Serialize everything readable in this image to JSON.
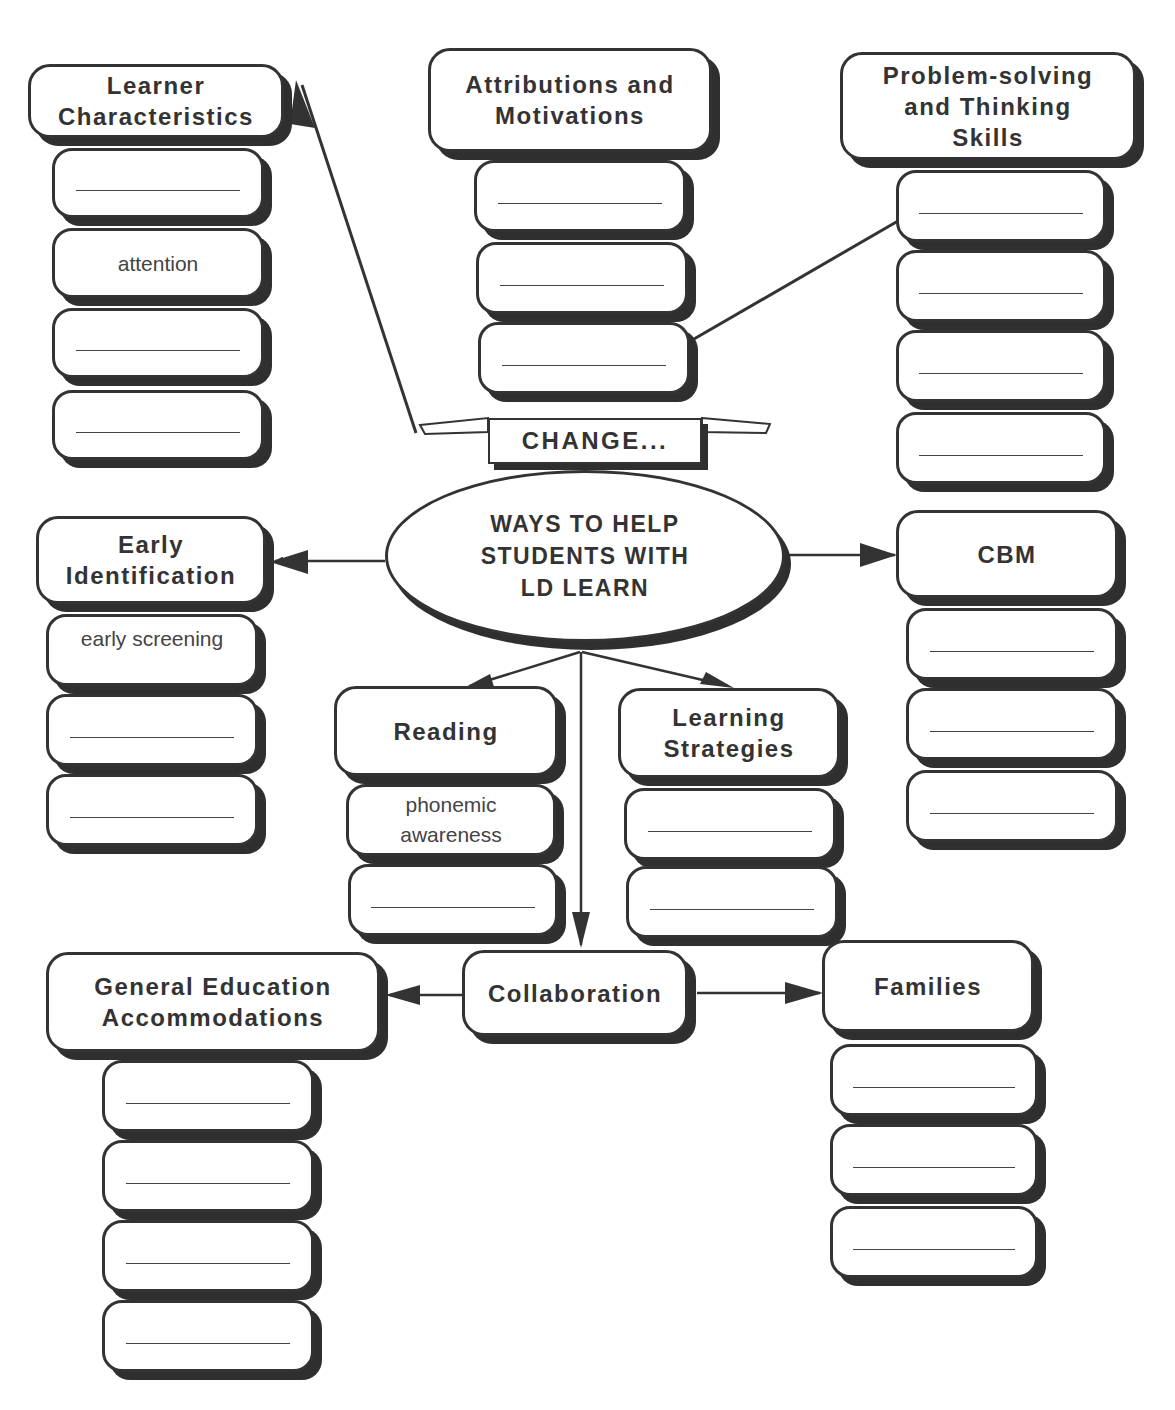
{
  "center": {
    "line1": "WAYS TO HELP",
    "line2": "STUDENTS WITH",
    "line3": "LD LEARN"
  },
  "banner": {
    "label": "CHANGE..."
  },
  "nodes": {
    "learner_characteristics": {
      "title_l1": "Learner",
      "title_l2": "Characteristics",
      "items": [
        "",
        "attention",
        "",
        ""
      ]
    },
    "attributions_motivations": {
      "title_l1": "Attributions and",
      "title_l2": "Motivations",
      "items": [
        "",
        "",
        ""
      ]
    },
    "problem_solving": {
      "title_l1": "Problem-solving",
      "title_l2": "and Thinking",
      "title_l3": "Skills",
      "items": [
        "",
        "",
        "",
        ""
      ]
    },
    "early_identification": {
      "title_l1": "Early",
      "title_l2": "Identification",
      "items": [
        "early screening",
        "",
        ""
      ]
    },
    "cbm": {
      "title_l1": "CBM",
      "items": [
        "",
        "",
        ""
      ]
    },
    "reading": {
      "title_l1": "Reading",
      "items": [
        "phonemic awareness",
        ""
      ],
      "item0_l1": "phonemic",
      "item0_l2": "awareness"
    },
    "learning_strategies": {
      "title_l1": "Learning",
      "title_l2": "Strategies",
      "items": [
        "",
        ""
      ]
    },
    "collaboration": {
      "title_l1": "Collaboration"
    },
    "general_education_accommodations": {
      "title_l1": "General Education",
      "title_l2": "Accommodations",
      "items": [
        "",
        "",
        "",
        ""
      ]
    },
    "families": {
      "title_l1": "Families",
      "items": [
        "",
        "",
        ""
      ]
    }
  },
  "colors": {
    "ink": "#333333",
    "shadow": "#2f2f2f",
    "background": "#ffffff"
  }
}
